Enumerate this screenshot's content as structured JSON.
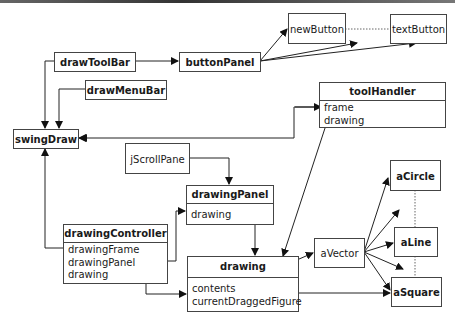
{
  "diagram": {
    "type": "object-relationship",
    "colors": {
      "line": "#222222",
      "box_border": "#444444",
      "background": "#ffffff"
    },
    "nodes": {
      "drawToolBar": {
        "label": "drawToolBar"
      },
      "drawMenuBar": {
        "label": "drawMenuBar"
      },
      "buttonPanel": {
        "label": "buttonPanel"
      },
      "newButton": {
        "label": "newButton"
      },
      "textButton": {
        "label": "textButton"
      },
      "swingDraw": {
        "label": "swingDraw"
      },
      "toolHandler": {
        "label": "toolHandler",
        "attributes": [
          "frame",
          "drawing"
        ]
      },
      "jScrollPane": {
        "label": "jScrollPane"
      },
      "drawingPanel": {
        "label": "drawingPanel",
        "attributes": [
          "drawing"
        ]
      },
      "drawingController": {
        "label": "drawingController",
        "attributes": [
          "drawingFrame",
          "drawingPanel",
          "drawing"
        ]
      },
      "drawing": {
        "label": "drawing",
        "attributes": [
          "contents",
          "currentDraggedFigure"
        ]
      },
      "aVector": {
        "label": "aVector"
      },
      "aCircle": {
        "label": "aCircle"
      },
      "aLine": {
        "label": "aLine"
      },
      "aSquare": {
        "label": "aSquare"
      }
    },
    "edges": [
      {
        "from": "drawToolBar",
        "to": "buttonPanel"
      },
      {
        "from": "drawToolBar",
        "to": "swingDraw"
      },
      {
        "from": "drawMenuBar",
        "to": "swingDraw"
      },
      {
        "from": "buttonPanel",
        "to": "newButton"
      },
      {
        "from": "buttonPanel",
        "to": "newButton/textButton (gap)"
      },
      {
        "from": "buttonPanel",
        "to": "textButton"
      },
      {
        "from": "newButton",
        "to": "textButton",
        "style": "dotted"
      },
      {
        "from": "toolHandler.frame",
        "to": "swingDraw",
        "bidirectional": true
      },
      {
        "from": "toolHandler.drawing",
        "to": "drawing"
      },
      {
        "from": "jScrollPane",
        "to": "drawingPanel"
      },
      {
        "from": "drawingPanel.drawing",
        "to": "drawing"
      },
      {
        "from": "drawingController.drawingFrame",
        "to": "swingDraw"
      },
      {
        "from": "drawingController.drawingPanel",
        "to": "drawingPanel"
      },
      {
        "from": "drawingController.drawing",
        "to": "drawing"
      },
      {
        "from": "drawing.contents",
        "to": "aVector"
      },
      {
        "from": "drawing.currentDraggedFigure",
        "to": "aSquare"
      },
      {
        "from": "aVector",
        "to": "aCircle"
      },
      {
        "from": "aVector",
        "to": "aCircle/aLine (gap)"
      },
      {
        "from": "aVector",
        "to": "aLine"
      },
      {
        "from": "aVector",
        "to": "aLine/aSquare (gap)"
      },
      {
        "from": "aVector",
        "to": "aSquare"
      },
      {
        "from": "aCircle",
        "to": "aLine",
        "style": "dotted"
      },
      {
        "from": "aLine",
        "to": "aSquare",
        "style": "dotted"
      }
    ]
  }
}
